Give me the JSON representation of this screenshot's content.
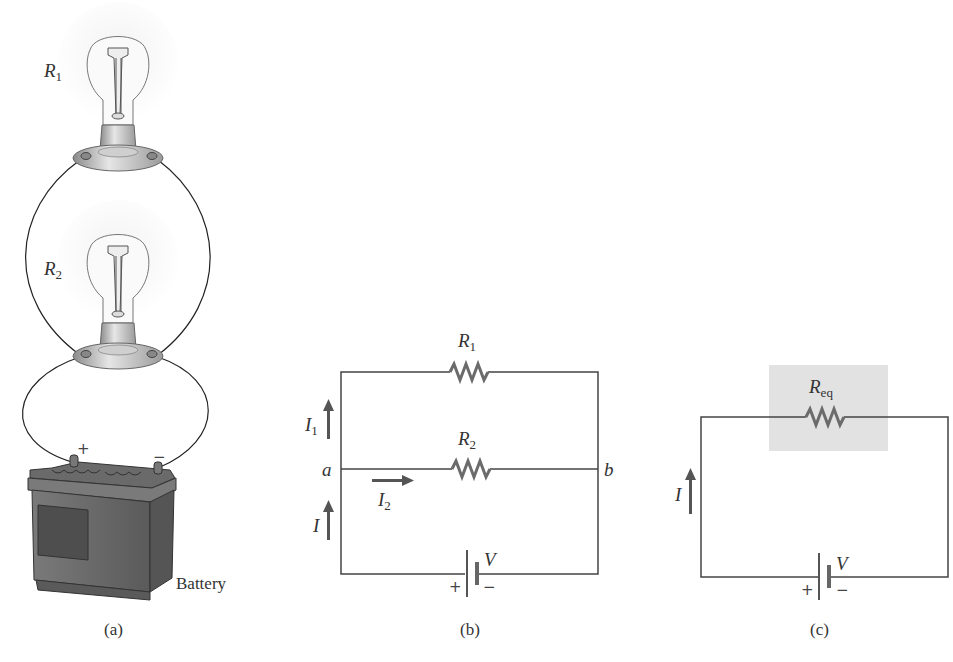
{
  "figure": {
    "panels": [
      {
        "id": "a",
        "caption": "(a)",
        "labels": {
          "bulb1": {
            "main": "R",
            "sub": "1"
          },
          "bulb2": {
            "main": "R",
            "sub": "2"
          },
          "battery": "Battery",
          "plus": "+",
          "minus": "−"
        }
      },
      {
        "id": "b",
        "caption": "(b)",
        "labels": {
          "r1": {
            "main": "R",
            "sub": "1"
          },
          "r2": {
            "main": "R",
            "sub": "2"
          },
          "i1": {
            "main": "I",
            "sub": "1"
          },
          "i2": {
            "main": "I",
            "sub": "2"
          },
          "i": "I",
          "node_a": "a",
          "node_b": "b",
          "v": "V",
          "plus": "+",
          "minus": "−"
        }
      },
      {
        "id": "c",
        "caption": "(c)",
        "labels": {
          "req": {
            "main": "R",
            "sub": "eq"
          },
          "i": "I",
          "v": "V",
          "plus": "+",
          "minus": "−"
        }
      }
    ],
    "colors": {
      "wire": "#444444",
      "resistor": "#6b6b6b",
      "arrow": "#555555",
      "highlight": "#e2e2e2",
      "battery_body": "#6e6e6e"
    }
  }
}
